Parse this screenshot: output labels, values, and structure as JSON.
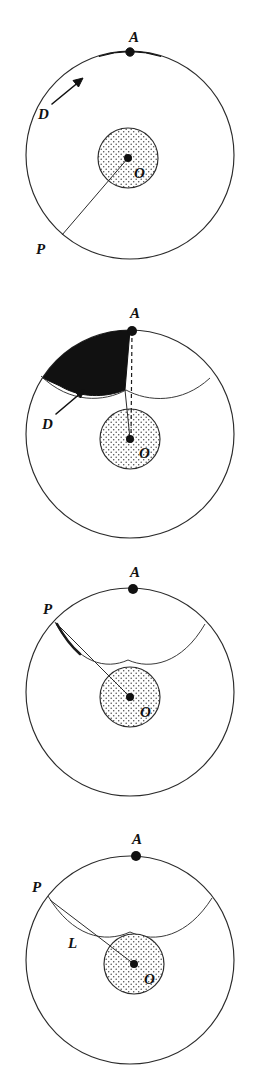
{
  "figure": {
    "background_color": "#ffffff",
    "ink_color": "#2b2b2b",
    "fill_color": "#111111",
    "stipple_color": "#555555",
    "panel_count": 4,
    "canvas": {
      "width": 257,
      "height": 1082
    }
  },
  "panels": [
    {
      "id": "panel-1",
      "index": 1,
      "top": 18,
      "height": 252,
      "outer_circle": {
        "cx": 130,
        "cy": 155,
        "r": 104
      },
      "inner_circle": {
        "cx": 128,
        "cy": 158,
        "r": 30,
        "texture": "stipple"
      },
      "points": [
        {
          "name": "A",
          "label": "A",
          "x": 130,
          "y": 52,
          "label_x": 133,
          "label_y": 44,
          "dot": true
        },
        {
          "name": "O",
          "label": "O",
          "x": 128,
          "y": 158,
          "label_x": 136,
          "label_y": 176,
          "dot": true
        },
        {
          "name": "P",
          "label": "P",
          "x": 62,
          "y": 235,
          "label_x": 42,
          "label_y": 253,
          "dot": false
        }
      ],
      "region": {
        "name": "D",
        "label": "D",
        "label_x": 52,
        "label_y": 108,
        "shape": "filled-cap",
        "filled": true
      },
      "arrow": {
        "from_x": 56,
        "from_y": 102,
        "to_x": 84,
        "to_y": 78
      },
      "segments": [
        {
          "name": "segment-P-O",
          "from": "P",
          "to": "O",
          "style": "solid"
        }
      ]
    },
    {
      "id": "panel-2",
      "index": 2,
      "top": 288,
      "height": 250,
      "outer_circle": {
        "cx": 130,
        "cy": 158,
        "r": 104
      },
      "inner_circle": {
        "cx": 130,
        "cy": 163,
        "r": 30,
        "texture": "stipple"
      },
      "points": [
        {
          "name": "A",
          "label": "A",
          "x": 133,
          "y": 55,
          "label_x": 134,
          "label_y": 44,
          "dot": true
        },
        {
          "name": "O",
          "label": "O",
          "x": 130,
          "y": 163,
          "label_x": 141,
          "label_y": 180,
          "dot": true
        }
      ],
      "region": {
        "name": "D",
        "label": "D",
        "label_x": 52,
        "label_y": 136,
        "shape": "filled-wedge",
        "filled": true
      },
      "arrow": {
        "from_x": 58,
        "from_y": 130,
        "to_x": 84,
        "to_y": 108
      },
      "segments": [
        {
          "name": "segment-A-O-dashed",
          "from": "A",
          "to": "O",
          "style": "dashed"
        },
        {
          "name": "segment-wedge-edge",
          "from": "wedge",
          "to": "O",
          "style": "solid"
        }
      ],
      "arc": {
        "name": "caustic-arc",
        "style": "solid"
      }
    },
    {
      "id": "panel-3",
      "index": 3,
      "top": 552,
      "height": 240,
      "outer_circle": {
        "cx": 130,
        "cy": 163,
        "r": 104
      },
      "inner_circle": {
        "cx": 130,
        "cy": 168,
        "r": 30,
        "texture": "stipple"
      },
      "points": [
        {
          "name": "A",
          "label": "A",
          "x": 133,
          "y": 60,
          "label_x": 134,
          "label_y": 48,
          "dot": true
        },
        {
          "name": "O",
          "label": "O",
          "x": 130,
          "y": 168,
          "label_x": 141,
          "label_y": 186,
          "dot": true
        },
        {
          "name": "P",
          "label": "P",
          "x": 63,
          "y": 85,
          "label_x": 47,
          "label_y": 76,
          "dot": false
        }
      ],
      "segments": [
        {
          "name": "segment-P-O",
          "from": "P",
          "to": "O",
          "style": "solid"
        },
        {
          "name": "arc-P-highlight",
          "style": "thick"
        }
      ],
      "arc": {
        "name": "caustic-arc",
        "style": "solid"
      }
    },
    {
      "id": "panel-4",
      "index": 4,
      "top": 818,
      "height": 250,
      "outer_circle": {
        "cx": 130,
        "cy": 168,
        "r": 104
      },
      "inner_circle": {
        "cx": 134,
        "cy": 172,
        "r": 30,
        "texture": "stipple"
      },
      "points": [
        {
          "name": "A",
          "label": "A",
          "x": 136,
          "y": 64,
          "label_x": 137,
          "label_y": 52,
          "dot": true
        },
        {
          "name": "O",
          "label": "O",
          "x": 134,
          "y": 172,
          "label_x": 146,
          "label_y": 190,
          "dot": true
        },
        {
          "name": "P",
          "label": "P",
          "x": 52,
          "y": 98,
          "label_x": 36,
          "label_y": 92,
          "dot": false
        }
      ],
      "region": {
        "name": "L",
        "label": "L",
        "label_x": 73,
        "label_y": 152,
        "shape": "length-label",
        "filled": false
      },
      "segments": [
        {
          "name": "segment-P-O",
          "from": "P",
          "to": "O",
          "style": "solid"
        }
      ],
      "arc": {
        "name": "caustic-arc",
        "style": "solid"
      }
    }
  ],
  "labels": {
    "A": "A",
    "O": "O",
    "P": "P",
    "D": "D",
    "L": "L"
  }
}
